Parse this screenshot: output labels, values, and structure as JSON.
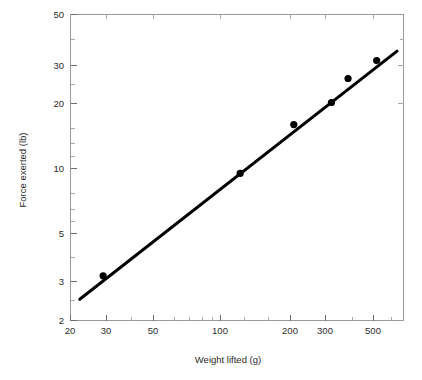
{
  "figure": {
    "background_color": "#ffffff",
    "frame_color": "#9a9a9a",
    "series_color": "#000000"
  },
  "chart_data": {
    "type": "scatter",
    "title": "",
    "subtitle": "",
    "xlabel": "Weight lifted (g)",
    "ylabel": "Force exerted (lb)",
    "xscale": "log",
    "yscale": "log",
    "xlim": [
      20,
      620
    ],
    "ylim": [
      2,
      50
    ],
    "grid": false,
    "legend": null,
    "xticks": [
      20,
      30,
      50,
      100,
      200,
      300,
      500
    ],
    "xticklabels": [
      "20",
      "30",
      "50",
      "100",
      "200",
      "300",
      "500"
    ],
    "yticks": [
      2,
      3,
      5,
      10,
      20,
      30,
      50
    ],
    "yticklabels": [
      "2",
      "3",
      "5",
      "10",
      "20",
      "30",
      "50"
    ],
    "x_minor_ticks": [
      40,
      60,
      70,
      80,
      90,
      400,
      600
    ],
    "y_minor_ticks": [
      4,
      6,
      7,
      8,
      9,
      40
    ],
    "series": [
      {
        "name": "Measurements",
        "marker": "filled-circle",
        "marker_color": "#000000",
        "x": [
          28,
          115,
          200,
          295,
          350,
          470
        ],
        "y": [
          3.2,
          9.4,
          15.7,
          19.8,
          25.5,
          30.8
        ]
      }
    ],
    "fit_line": {
      "name": "Fitted power law",
      "color": "#000000",
      "x_start": 22,
      "y_start": 2.5,
      "x_end": 580,
      "y_end": 34.0
    },
    "annotations": []
  },
  "axis": {
    "x_title": "Weight lifted (g)",
    "y_title": "Force exerted (lb)"
  }
}
